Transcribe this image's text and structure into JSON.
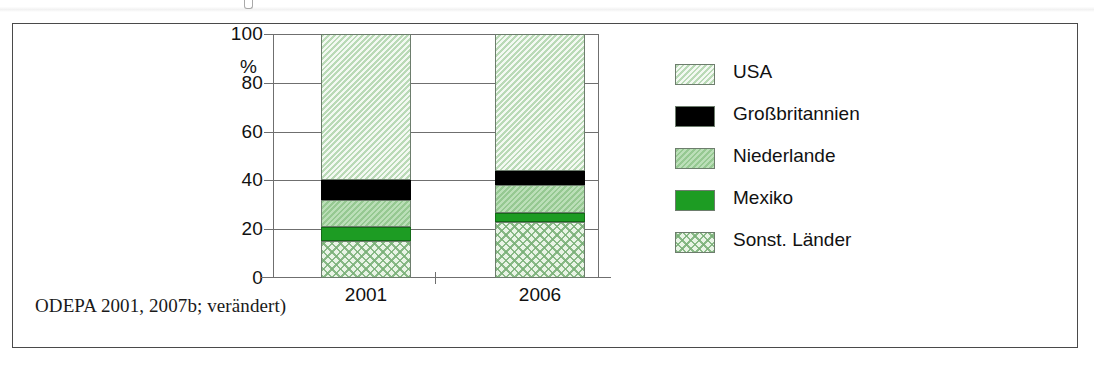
{
  "figure": {
    "source_note": "ODEPA 2001, 2007b; verändert)"
  },
  "axis": {
    "y_unit": "%",
    "y_ticks": [
      "100",
      "80",
      "60",
      "40",
      "20",
      "0"
    ],
    "x_ticks": [
      "2001",
      "2006"
    ]
  },
  "legend": {
    "items": [
      {
        "label": "USA",
        "key": "usa",
        "swatch": "light-green-hatch"
      },
      {
        "label": "Großbritannien",
        "key": "gb",
        "swatch": "black-solid"
      },
      {
        "label": "Niederlande",
        "key": "nl",
        "swatch": "medium-green"
      },
      {
        "label": "Mexiko",
        "key": "mx",
        "swatch": "dark-green-solid"
      },
      {
        "label": "Sonst. Länder",
        "key": "other",
        "swatch": "green-crosshatch"
      }
    ]
  },
  "colors": {
    "usa": "#cfe8cd",
    "gb": "#000000",
    "nl": "#9ed19a",
    "mx": "#1d9c23",
    "other": "#e9f4e6",
    "grid": "#6f6f6f",
    "frame": "#4a4a4a"
  },
  "chart_data": {
    "type": "bar",
    "stacked": true,
    "title": "",
    "xlabel": "",
    "ylabel": "%",
    "ylim": [
      0,
      100
    ],
    "yticks": [
      0,
      20,
      40,
      60,
      80,
      100
    ],
    "grid": true,
    "legend_position": "right",
    "categories": [
      "2001",
      "2006"
    ],
    "series": [
      {
        "name": "Sonst. Länder",
        "key": "other",
        "values": [
          15,
          23
        ]
      },
      {
        "name": "Mexiko",
        "key": "mx",
        "values": [
          6,
          3.5
        ]
      },
      {
        "name": "Niederlande",
        "key": "nl",
        "values": [
          11,
          11.5
        ]
      },
      {
        "name": "Großbritannien",
        "key": "gb",
        "values": [
          8,
          6
        ]
      },
      {
        "name": "USA",
        "key": "usa",
        "values": [
          60,
          56
        ]
      }
    ]
  }
}
